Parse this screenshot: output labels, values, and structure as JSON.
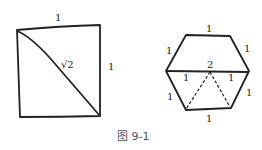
{
  "figure": {
    "caption": "图 9-1",
    "square": {
      "top_label": "1",
      "right_label": "1",
      "diagonal_label": "√2"
    },
    "hexagon": {
      "top_label": "1",
      "upper_left_label": "1",
      "upper_right_label": "1",
      "diameter_label": "2",
      "mid_left_label": "1",
      "mid_right_label": "1",
      "lower_left_label": "1",
      "lower_right_label": "1",
      "bottom_label": "1"
    }
  }
}
